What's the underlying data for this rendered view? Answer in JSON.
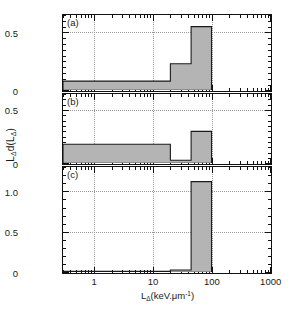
{
  "figure": {
    "xlabel": "LΔ(keV.μm⁻¹)",
    "xlabel_parts": {
      "base": "L",
      "sub": "Δ",
      "rest": "(keV.μm",
      "sup": "-1",
      "tail": ")"
    },
    "ylabel": "LΔd(LΔ)",
    "ylabel_parts": {
      "b1": "L",
      "s1": "Δ",
      "mid": "d(L",
      "s2": "Δ",
      "tail": ")"
    }
  },
  "panels": [
    {
      "tag": "(a)",
      "ytick_labels": [
        "0.5",
        "0"
      ],
      "ytick_values": [
        0.5,
        0
      ],
      "ylim": [
        0,
        0.65
      ],
      "gridlines_y": [
        0.5
      ]
    },
    {
      "tag": "(b)",
      "ytick_labels": [
        "0.5",
        "0"
      ],
      "ytick_values": [
        0.5,
        0
      ],
      "ylim": [
        0,
        0.65
      ],
      "gridlines_y": [
        0.5
      ]
    },
    {
      "tag": "(c)",
      "ytick_labels": [
        "1.0",
        "0.5",
        "0"
      ],
      "ytick_values": [
        1.0,
        0.5,
        0
      ],
      "ylim": [
        0,
        1.3
      ],
      "gridlines_y": [
        1.0,
        0.5
      ]
    }
  ],
  "xaxis": {
    "scale": "log",
    "xlim": [
      0.3,
      1000
    ],
    "tick_labels": [
      "1",
      "10",
      "100",
      "1000"
    ],
    "tick_values": [
      1,
      10,
      100,
      1000
    ],
    "gridlines_x": [
      1,
      10,
      100
    ]
  },
  "chart_data": {
    "type": "bar",
    "title": "",
    "xlabel": "LΔ (keV.μm⁻¹)",
    "ylabel": "LΔ d(LΔ)",
    "xscale": "log",
    "xlim": [
      0.3,
      1000
    ],
    "grid": true,
    "legend": null,
    "panels": [
      {
        "name": "(a)",
        "ylim": [
          0,
          0.65
        ],
        "yticks": [
          0,
          0.5
        ],
        "bin_edges": [
          0.3,
          20,
          45,
          100
        ],
        "values": [
          0.08,
          0.23,
          0.55
        ]
      },
      {
        "name": "(b)",
        "ylim": [
          0,
          0.65
        ],
        "yticks": [
          0,
          0.5
        ],
        "bin_edges": [
          0.3,
          20,
          45,
          100
        ],
        "values": [
          0.18,
          0.03,
          0.3
        ]
      },
      {
        "name": "(c)",
        "ylim": [
          0,
          1.3
        ],
        "yticks": [
          0,
          0.5,
          1.0
        ],
        "bin_edges": [
          0.3,
          20,
          45,
          100
        ],
        "values": [
          0.015,
          0.03,
          1.12
        ]
      }
    ]
  }
}
